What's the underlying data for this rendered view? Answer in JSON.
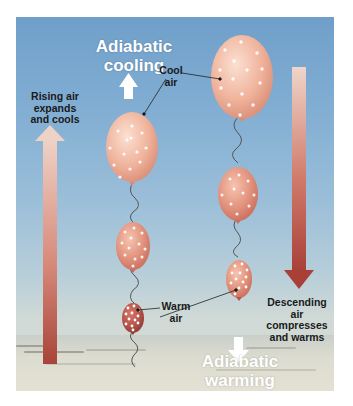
{
  "diagram": {
    "title_top": [
      "Adiabatic",
      "cooling"
    ],
    "title_bottom": [
      "Adiabatic",
      "warming"
    ],
    "left_caption": [
      "Rising air",
      "expands",
      "and cools"
    ],
    "right_caption": [
      "Descending",
      "air",
      "compresses",
      "and warms"
    ],
    "cool_air_label": [
      "Cool",
      "air"
    ],
    "warm_air_label": [
      "Warm",
      "air"
    ],
    "colors": {
      "sky_top": "#6f9fc9",
      "sky_bottom": "#d8dcd2",
      "balloon_cool": "#f2b8a0",
      "balloon_warm": "#b8534a",
      "arrow_warm": "#b8453c",
      "arrow_cool": "#f0d4c8"
    }
  }
}
